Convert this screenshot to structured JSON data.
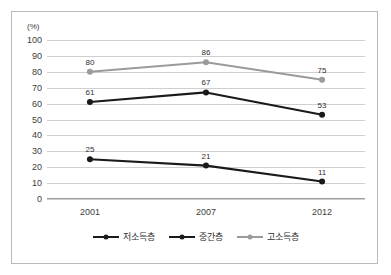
{
  "chart_data": {
    "type": "line",
    "title": "",
    "subtitle": "",
    "xlabel": "",
    "ylabel": "(%)",
    "unit_label": "(%)",
    "categories": [
      "2001",
      "2007",
      "2012"
    ],
    "x_tick_labels": [
      "2001",
      "2007",
      "2012"
    ],
    "y_tick_labels": [
      "0",
      "10",
      "20",
      "30",
      "40",
      "50",
      "60",
      "70",
      "80",
      "90",
      "100"
    ],
    "y_ticks": [
      0,
      10,
      20,
      30,
      40,
      50,
      60,
      70,
      80,
      90,
      100
    ],
    "ylim": [
      0,
      100
    ],
    "grid": true,
    "grid_axis": "y",
    "legend_position": "bottom-center",
    "series": [
      {
        "name": "저소득층",
        "values": [
          25,
          21,
          11
        ],
        "labels": [
          "25",
          "21",
          "11"
        ],
        "color": "#1a1a1a",
        "marker": "circle",
        "line_width": 2.2
      },
      {
        "name": "중간층",
        "values": [
          61,
          67,
          53
        ],
        "labels": [
          "61",
          "67",
          "53"
        ],
        "color": "#1a1a1a",
        "marker": "circle",
        "line_width": 2.2
      },
      {
        "name": "고소득층",
        "values": [
          80,
          86,
          75
        ],
        "labels": [
          "80",
          "86",
          "75"
        ],
        "color": "#9b9b9b",
        "marker": "circle",
        "line_width": 2.0
      }
    ],
    "colors": {
      "low_income": "#1a1a1a",
      "middle_income": "#1a1a1a",
      "high_income": "#9b9b9b",
      "gridline": "#cfcfcf",
      "axis": "#9e9e9e",
      "border": "#b9b9b9",
      "text": "#2f2f2f",
      "background": "#ffffff"
    }
  },
  "legend": {
    "items": [
      {
        "label": "저소득층",
        "color": "#1a1a1a"
      },
      {
        "label": "중간층",
        "color": "#1a1a1a"
      },
      {
        "label": "고소득층",
        "color": "#9b9b9b"
      }
    ]
  }
}
